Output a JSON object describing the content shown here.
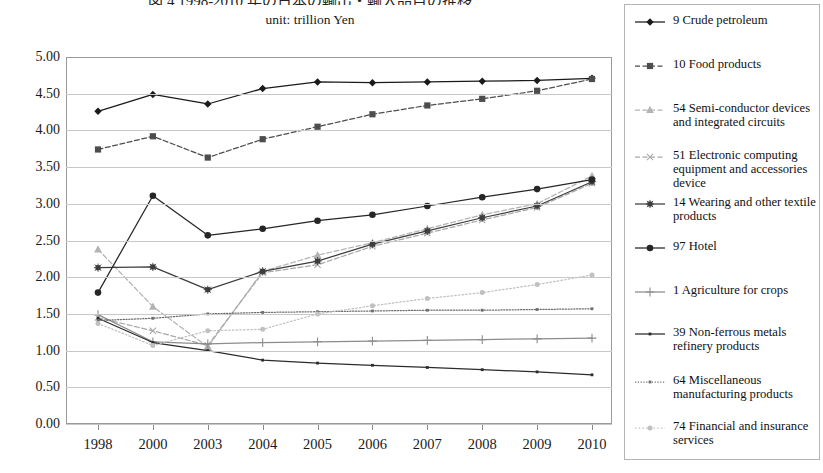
{
  "title": "図 4  1998-2010 年の日本の輸出・輸入品目の推移",
  "subtitle": "unit: trillion  Yen",
  "axes": {
    "y_ticks": [
      "5.00",
      "4.50",
      "4.00",
      "3.50",
      "3.00",
      "2.50",
      "2.00",
      "1.50",
      "1.00",
      "0.50",
      "0.00"
    ],
    "x_ticks": [
      "1998",
      "2000",
      "2003",
      "2004",
      "2005",
      "2006",
      "2007",
      "2008",
      "2009",
      "2010"
    ]
  },
  "legend": {
    "items": [
      {
        "label": "9 Crude petroleum",
        "style": "solid-diamond",
        "color": "#1a1a1a",
        "top": 8
      },
      {
        "label": "10 Food products",
        "style": "dash-square",
        "color": "#4d4d4d",
        "top": 52
      },
      {
        "label": "54 Semi-conductor devices and integrated circuits",
        "style": "dash-triangle",
        "color": "#b3b3b3",
        "top": 96
      },
      {
        "label": "51 Electronic computing equipment and accessories device",
        "style": "dash-x",
        "color": "#a8a8a8",
        "top": 143
      },
      {
        "label": "14 Wearing and other textile products",
        "style": "solid-star",
        "color": "#3d3d3d",
        "top": 190
      },
      {
        "label": "97 Hotel",
        "style": "solid-circle",
        "color": "#262626",
        "top": 234
      },
      {
        "label": "1 Agriculture for crops",
        "style": "solid-plus",
        "color": "#8c8c8c",
        "top": 278
      },
      {
        "label": "39 Non-ferrous metals refinery products",
        "style": "solid-plain",
        "color": "#2b2b2b",
        "top": 320
      },
      {
        "label": "64 Miscellaneous manufacturing products",
        "style": "dotted-plain",
        "color": "#6e6e6e",
        "top": 368
      },
      {
        "label": "74 Financial and insurance services",
        "style": "dot-lightcircle",
        "color": "#c0c0c0",
        "top": 414
      }
    ]
  },
  "chart_data": {
    "type": "line",
    "title": "図 4  1998-2010 年の日本の輸出・輸入品目の推移",
    "subtitle": "unit: trillion  Yen",
    "xlabel": "",
    "ylabel": "",
    "ylim": [
      0.0,
      5.0
    ],
    "ytick_step": 0.5,
    "grid": true,
    "legend_position": "right",
    "categories": [
      "1998",
      "2000",
      "2003",
      "2004",
      "2005",
      "2006",
      "2007",
      "2008",
      "2009",
      "2010"
    ],
    "series": [
      {
        "name": "9 Crude petroleum",
        "values": [
          4.26,
          4.49,
          4.36,
          4.57,
          4.66,
          4.65,
          4.66,
          4.67,
          4.68,
          4.71
        ],
        "style": "solid-diamond",
        "color": "#1a1a1a"
      },
      {
        "name": "10 Food products",
        "values": [
          3.74,
          3.92,
          3.63,
          3.88,
          4.05,
          4.22,
          4.34,
          4.43,
          4.54,
          4.7
        ],
        "style": "dash-square",
        "color": "#4d4d4d"
      },
      {
        "name": "54 Semi-conductor devices and integrated circuits",
        "values": [
          2.38,
          1.6,
          1.05,
          2.08,
          2.3,
          2.47,
          2.66,
          2.85,
          3.0,
          3.38
        ],
        "style": "dash-triangle",
        "color": "#b3b3b3"
      },
      {
        "name": "51 Electronic computing equipment and accessories device",
        "values": [
          1.45,
          1.27,
          1.07,
          2.06,
          2.17,
          2.42,
          2.6,
          2.78,
          2.95,
          3.28
        ],
        "style": "dash-x",
        "color": "#a8a8a8"
      },
      {
        "name": "14 Wearing and other textile products",
        "values": [
          2.13,
          2.14,
          1.83,
          2.08,
          2.22,
          2.45,
          2.63,
          2.81,
          2.97,
          3.3
        ],
        "style": "solid-star",
        "color": "#3d3d3d"
      },
      {
        "name": "97 Hotel",
        "values": [
          1.79,
          3.11,
          2.57,
          2.66,
          2.77,
          2.85,
          2.97,
          3.09,
          3.2,
          3.33
        ],
        "style": "solid-circle",
        "color": "#262626"
      },
      {
        "name": "1 Agriculture for crops",
        "values": [
          1.49,
          1.12,
          1.09,
          1.11,
          1.12,
          1.13,
          1.14,
          1.15,
          1.16,
          1.17
        ],
        "style": "solid-plus",
        "color": "#8c8c8c"
      },
      {
        "name": "39 Non-ferrous metals refinery products",
        "values": [
          1.44,
          1.11,
          1.0,
          0.87,
          0.83,
          0.8,
          0.77,
          0.74,
          0.71,
          0.67
        ],
        "style": "solid-plain",
        "color": "#2b2b2b"
      },
      {
        "name": "64 Miscellaneous manufacturing products",
        "values": [
          1.41,
          1.44,
          1.5,
          1.52,
          1.53,
          1.54,
          1.55,
          1.55,
          1.56,
          1.57
        ],
        "style": "dotted-plain",
        "color": "#6e6e6e"
      },
      {
        "name": "74 Financial and insurance services",
        "values": [
          1.37,
          1.07,
          1.27,
          1.29,
          1.5,
          1.61,
          1.71,
          1.79,
          1.9,
          2.03
        ],
        "style": "dot-lightcircle",
        "color": "#c0c0c0"
      }
    ]
  }
}
